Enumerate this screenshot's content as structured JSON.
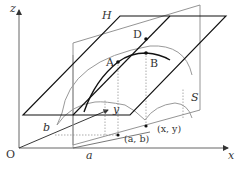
{
  "diagram": {
    "axes": {
      "x_label": "x",
      "y_label": "y",
      "z_label": "z",
      "origin_label": "O"
    },
    "points": {
      "A": "A",
      "B": "B",
      "D": "D"
    },
    "plane_label": "H",
    "surface_label": "S",
    "ground_labels": {
      "a": "a",
      "b": "b",
      "ab": "(a, b)",
      "xy": "(x, y)"
    },
    "colors": {
      "ink": "#111111",
      "gray": "#888888",
      "axis": "#555555"
    }
  }
}
